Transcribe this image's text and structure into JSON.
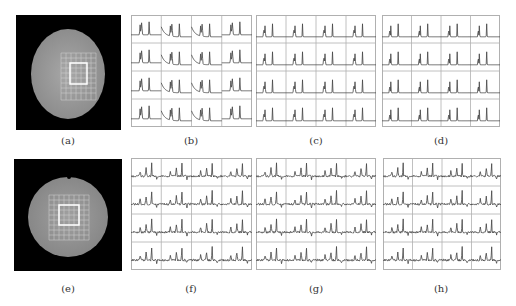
{
  "figure": {
    "panels": [
      {
        "id": "a",
        "label": "(a)",
        "type": "image",
        "description": "circular phantom MRI image with grid overlay and highlighted square region"
      },
      {
        "id": "b",
        "label": "(b)",
        "type": "spectra-grid",
        "rows": 4,
        "cols": 4,
        "description": "spectra with sloped baseline and two peaks"
      },
      {
        "id": "c",
        "label": "(c)",
        "type": "spectra-grid",
        "rows": 4,
        "cols": 4,
        "description": "baseline-corrected spectra with two peaks"
      },
      {
        "id": "d",
        "label": "(d)",
        "type": "spectra-grid",
        "rows": 4,
        "cols": 4,
        "description": "fitted spectra with two sharp peaks"
      },
      {
        "id": "e",
        "label": "(e)",
        "type": "image",
        "description": "circular phantom MRI image with grid overlay and highlighted square region"
      },
      {
        "id": "f",
        "label": "(f)",
        "type": "spectra-grid",
        "rows": 4,
        "cols": 4,
        "description": "noisy in-vivo-like spectra with multiple peaks"
      },
      {
        "id": "g",
        "label": "(g)",
        "type": "spectra-grid",
        "rows": 4,
        "cols": 4,
        "description": "processed spectra with multiple peaks"
      },
      {
        "id": "h",
        "label": "(h)",
        "type": "spectra-grid",
        "rows": 4,
        "cols": 4,
        "description": "processed spectra with multiple peaks"
      }
    ]
  },
  "colors": {
    "image_bg": "#000000",
    "phantom": "#9a9a9a",
    "grid_line": "#c8c8c8",
    "grid_highlight": "#ffffff",
    "spectrum_line": "#444444",
    "cell_border": "#b0b0b0"
  }
}
